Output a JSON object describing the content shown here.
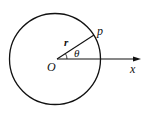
{
  "diagram": {
    "type": "polar-coordinate-circle",
    "labels": {
      "point": "p",
      "radius": "r",
      "angle": "θ",
      "origin": "O",
      "axis": "x"
    },
    "colors": {
      "stroke": "#111111",
      "background": "#ffffff"
    }
  }
}
